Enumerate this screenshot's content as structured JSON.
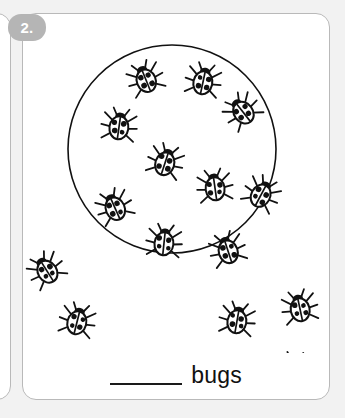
{
  "worksheet": {
    "question_number": "2.",
    "answer_blank_placeholder": "",
    "answer_unit_label": "bugs",
    "colors": {
      "page_background": "#f2f2f2",
      "card_background": "#ffffff",
      "card_border": "#b9b9b9",
      "badge_background": "#b5b5b5",
      "badge_text": "#ffffff",
      "ink": "#111111"
    }
  },
  "chart_data": {
    "type": "scatter",
    "title": "",
    "subtitle": "",
    "xlabel": "",
    "ylabel": "",
    "grid": false,
    "legend": "none",
    "xlim": [
      0,
      308
    ],
    "ylim": [
      0,
      340
    ],
    "annotations": [
      {
        "text": "bugs",
        "role": "answer-unit"
      },
      {
        "text": "2.",
        "role": "question-number"
      }
    ],
    "grouping_circle": {
      "cx": 150,
      "cy": 136,
      "r": 104
    },
    "counts": {
      "inside_circle": 10,
      "outside_circle": 5,
      "total": 15
    },
    "categories": [
      "inside circle",
      "outside circle"
    ],
    "values": [
      10,
      5
    ],
    "series": [
      {
        "name": "ladybugs inside circle",
        "points": [
          {
            "x": 124,
            "y": 67,
            "rot": -22
          },
          {
            "x": 181,
            "y": 69,
            "rot": 12
          },
          {
            "x": 221,
            "y": 99,
            "rot": -38
          },
          {
            "x": 97,
            "y": 114,
            "rot": 8
          },
          {
            "x": 143,
            "y": 150,
            "rot": 18
          },
          {
            "x": 193,
            "y": 175,
            "rot": -8
          },
          {
            "x": 239,
            "y": 182,
            "rot": 28
          },
          {
            "x": 93,
            "y": 195,
            "rot": -24
          },
          {
            "x": 142,
            "y": 230,
            "rot": 6
          },
          {
            "x": 206,
            "y": 238,
            "rot": -18
          }
        ]
      },
      {
        "name": "ladybugs outside circle",
        "points": [
          {
            "x": 25,
            "y": 258,
            "rot": -32
          },
          {
            "x": 55,
            "y": 309,
            "rot": 14
          },
          {
            "x": 215,
            "y": 308,
            "rot": 10
          },
          {
            "x": 278,
            "y": 296,
            "rot": -12
          },
          {
            "x": 272,
            "y": 358,
            "rot": 4
          }
        ]
      }
    ]
  }
}
